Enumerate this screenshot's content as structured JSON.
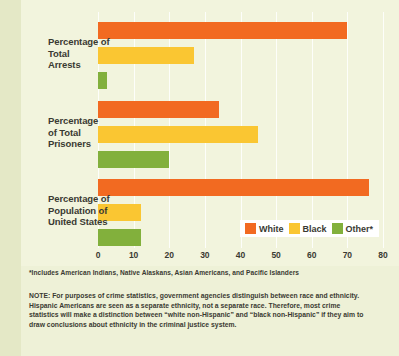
{
  "chart_data": {
    "type": "bar",
    "orientation": "horizontal",
    "title": "",
    "xlabel": "",
    "ylabel": "",
    "categories": [
      "Percentage of Total Arrests",
      "Percentage of Total Prisoners",
      "Percentage of Population of United States"
    ],
    "series": [
      {
        "name": "White",
        "color": "#f26a21",
        "values": [
          70,
          34,
          76
        ]
      },
      {
        "name": "Black",
        "color": "#fac632",
        "values": [
          27,
          45,
          12
        ]
      },
      {
        "name": "Other*",
        "color": "#82b03c",
        "values": [
          2.5,
          20,
          12
        ]
      }
    ],
    "xlim": [
      0,
      80
    ],
    "xticks": [
      0,
      10,
      20,
      30,
      40,
      50,
      60,
      70,
      80
    ],
    "grid": true,
    "legend_position": "inside-bottom-right"
  },
  "category_labels": [
    {
      "line1": "Percentage of",
      "line2": "Total",
      "line3": "Arrests"
    },
    {
      "line1": "Percentage",
      "line2": "of Total",
      "line3": "Prisoners"
    },
    {
      "line1": "Percentage of",
      "line2": "Population of",
      "line3": "United States"
    }
  ],
  "axis": {
    "ticks": [
      "0",
      "10",
      "20",
      "30",
      "40",
      "50",
      "60",
      "70",
      "80"
    ]
  },
  "legend": {
    "items": [
      {
        "label": "White",
        "color": "#f26a21"
      },
      {
        "label": "Black",
        "color": "#fac632"
      },
      {
        "label": "Other*",
        "color": "#82b03c"
      }
    ]
  },
  "footnote": "*Includes American Indians, Native Alaskans, Asian Americans, and Pacific Islanders",
  "note": "NOTE:  For purposes of crime statistics, government agencies distinguish between race and ethnicity. Hispanic Americans are seen as a separate ethnicity, not a separate race.  Therefore, most crime statistics will make a distinction between “white non-Hispanic” and “black non-Hispanic” if they aim to draw conclusions about ethnicity in the criminal justice system.",
  "colors": {
    "background": "#eef1d7",
    "panel": "#f2f4dd",
    "text": "#3a3a32",
    "white_series": "#f26a21",
    "black_series": "#fac632",
    "other_series": "#82b03c"
  }
}
